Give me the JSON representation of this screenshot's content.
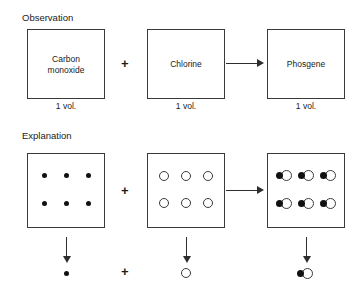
{
  "figure": {
    "type": "chemistry-reaction-diagram",
    "reaction": "carbon monoxide + chlorine -> phosgene"
  },
  "sections": {
    "observation": {
      "heading": "Observation",
      "boxes": [
        {
          "label": "Carbon\nmonoxide",
          "label_line1": "Carbon",
          "label_line2": "monoxide",
          "volume": "1 vol."
        },
        {
          "label": "Chlorine",
          "label_line1": "Chlorine",
          "label_line2": "",
          "volume": "1 vol."
        },
        {
          "label": "Phosgene",
          "label_line1": "Phosgene",
          "label_line2": "",
          "volume": "1 vol."
        }
      ],
      "plus_symbol": "+",
      "arrow_symbol": "→"
    },
    "explanation": {
      "heading": "Explanation",
      "boxes": [
        {
          "particle_type": "filled-dot",
          "count": 6,
          "rows": 2,
          "cols": 3
        },
        {
          "particle_type": "open-circle",
          "count": 6,
          "rows": 2,
          "cols": 3
        },
        {
          "particle_type": "dot-circle-molecule",
          "count": 6,
          "rows": 2,
          "cols": 3
        }
      ],
      "plus_symbol": "+",
      "arrow_symbol": "→",
      "down_arrow_symbol": "↓",
      "summary": [
        {
          "particle_type": "filled-dot"
        },
        {
          "particle_type": "open-circle"
        },
        {
          "particle_type": "dot-circle-molecule"
        }
      ]
    }
  },
  "colors": {
    "box_border": "#3a3a3a",
    "particle_filled": "#111111",
    "particle_open_fill": "#ffffff",
    "particle_open_border": "#3a3a3a",
    "arrow": "#2e2e2e",
    "text": "#1a1a1a",
    "background": "#ffffff"
  }
}
